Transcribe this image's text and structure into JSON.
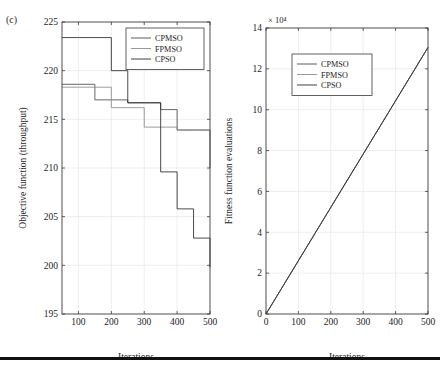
{
  "figure": {
    "panel_tag": "(c)",
    "has_bottom_rule": true
  },
  "colors": {
    "cpmso": "#4a4a4a",
    "fpmso": "#8d8d8d",
    "cpso": "#2a2a2a",
    "axis": "#3a3a3a",
    "grid": "#dcdcdc",
    "background": "#ffffff"
  },
  "chart_data": [
    {
      "id": "left",
      "type": "line",
      "title": "",
      "xlabel": "Iterations",
      "ylabel": "Objective function (throughput)",
      "xlim": [
        50,
        500
      ],
      "ylim": [
        195,
        225
      ],
      "xticks": [
        100,
        200,
        300,
        400,
        500
      ],
      "yticks": [
        195,
        200,
        205,
        210,
        215,
        220,
        225
      ],
      "grid": true,
      "step": "post",
      "legend": [
        "CPMSO",
        "FPMSO",
        "CPSO"
      ],
      "legend_position": "top-right",
      "series": [
        {
          "name": "CPMSO",
          "color": "#4a4a4a",
          "x": [
            50,
            100,
            150,
            200,
            250,
            300,
            350,
            400,
            450,
            500
          ],
          "values": [
            218.6,
            218.6,
            217.0,
            217.0,
            216.7,
            216.7,
            216.0,
            213.9,
            213.9,
            210.0
          ]
        },
        {
          "name": "FPMSO",
          "color": "#8d8d8d",
          "x": [
            50,
            100,
            150,
            200,
            250,
            300,
            350,
            400,
            450,
            500
          ],
          "values": [
            218.3,
            218.3,
            218.3,
            216.2,
            216.2,
            214.2,
            214.2,
            213.9,
            213.9,
            213.9
          ]
        },
        {
          "name": "CPSO",
          "color": "#2a2a2a",
          "x": [
            50,
            100,
            150,
            200,
            250,
            300,
            350,
            400,
            450,
            500
          ],
          "values": [
            223.4,
            223.4,
            223.4,
            220.0,
            216.7,
            216.7,
            209.6,
            205.8,
            202.8,
            199.8
          ]
        }
      ]
    },
    {
      "id": "right",
      "type": "line",
      "title": "",
      "xlabel": "Iterations",
      "ylabel": "Fitness function evaluations",
      "exponent_label": "× 10⁴",
      "xlim": [
        0,
        500
      ],
      "ylim": [
        0,
        14
      ],
      "xticks": [
        0,
        100,
        200,
        300,
        400,
        500
      ],
      "yticks": [
        0,
        2,
        4,
        6,
        8,
        10,
        12,
        14
      ],
      "grid": true,
      "legend": [
        "CPMSO",
        "FPMSO",
        "CPSO"
      ],
      "legend_position": "top-left",
      "series": [
        {
          "name": "CPMSO",
          "color": "#4a4a4a",
          "x": [
            0,
            500
          ],
          "values": [
            0,
            13.05
          ]
        },
        {
          "name": "FPMSO",
          "color": "#8d8d8d",
          "x": [
            0,
            500
          ],
          "values": [
            0,
            13.05
          ]
        },
        {
          "name": "CPSO",
          "color": "#2a2a2a",
          "x": [
            0,
            500
          ],
          "values": [
            0,
            13.05
          ]
        }
      ]
    }
  ]
}
